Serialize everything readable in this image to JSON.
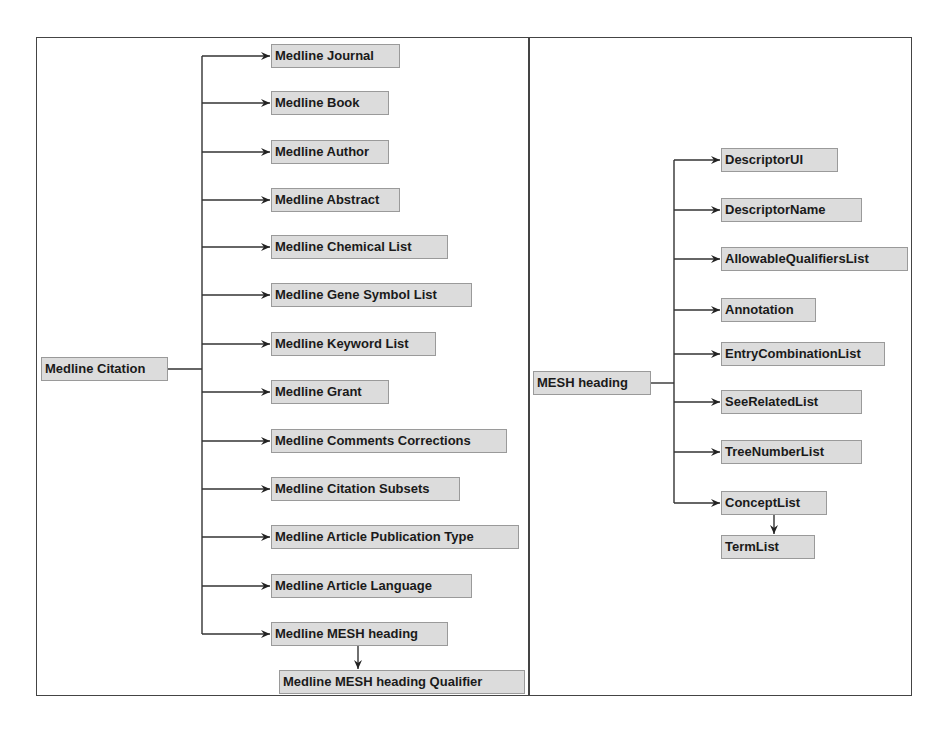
{
  "left_panel": {
    "root": {
      "label": "Medline Citation",
      "x": 41,
      "y": 357,
      "w": 127
    },
    "trunk_x": 202,
    "children": [
      {
        "label": "Medline Journal",
        "y": 44,
        "w": 129
      },
      {
        "label": "Medline Book",
        "y": 91,
        "w": 118
      },
      {
        "label": "Medline Author",
        "y": 140,
        "w": 118
      },
      {
        "label": "Medline Abstract",
        "y": 188,
        "w": 129
      },
      {
        "label": "Medline Chemical List",
        "y": 235,
        "w": 177
      },
      {
        "label": "Medline Gene Symbol List",
        "y": 283,
        "w": 201
      },
      {
        "label": "Medline Keyword List",
        "y": 332,
        "w": 165
      },
      {
        "label": "Medline Grant",
        "y": 380,
        "w": 118
      },
      {
        "label": "Medline Comments Corrections",
        "y": 429,
        "w": 236
      },
      {
        "label": "Medline Citation Subsets",
        "y": 477,
        "w": 189
      },
      {
        "label": "Medline Article Publication Type",
        "y": 525,
        "w": 248
      },
      {
        "label": "Medline Article Language",
        "y": 574,
        "w": 201
      },
      {
        "label": "Medline MESH heading",
        "y": 622,
        "w": 177
      }
    ],
    "children_x": 271,
    "sub_child": {
      "label": "Medline MESH heading Qualifier",
      "x": 279,
      "y": 670,
      "w": 246,
      "arrow_x": 358
    }
  },
  "right_panel": {
    "root": {
      "label": "MESH heading",
      "x": 533,
      "y": 371,
      "w": 118
    },
    "trunk_x": 674,
    "children_x": 721,
    "children": [
      {
        "label": "DescriptorUI",
        "y": 148,
        "w": 117
      },
      {
        "label": "DescriptorName",
        "y": 198,
        "w": 141
      },
      {
        "label": "AllowableQualifiersList",
        "y": 247,
        "w": 187
      },
      {
        "label": "Annotation",
        "y": 298,
        "w": 95
      },
      {
        "label": "EntryCombinationList",
        "y": 342,
        "w": 164
      },
      {
        "label": "SeeRelatedList",
        "y": 390,
        "w": 141
      },
      {
        "label": "TreeNumberList",
        "y": 440,
        "w": 141
      },
      {
        "label": "ConceptList",
        "y": 491,
        "w": 106
      }
    ],
    "sub_child": {
      "label": "TermList",
      "x": 721,
      "y": 535,
      "w": 94,
      "arrow_x": 774
    }
  },
  "colors": {
    "node_fill": "#dcdcdc",
    "node_border": "#9a9a9a",
    "text": "#1a1a1a",
    "line": "#333333",
    "frame": "#444444"
  }
}
